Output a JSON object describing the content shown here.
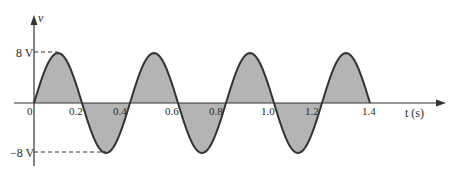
{
  "chart_data": {
    "type": "line",
    "title": "",
    "xlabel": "t (s)",
    "ylabel": "v",
    "function": "v(t) = 8 sin(2*pi*t/0.4) V",
    "amplitude": 8,
    "period": 0.4,
    "x_ticks": [
      "0",
      "0.2",
      "0.4",
      "0.6",
      "0.8",
      "1.0",
      "1.2",
      "1.4"
    ],
    "y_ticks": [
      "8 V",
      "-8 V"
    ],
    "x": [
      0,
      0.1,
      0.2,
      0.3,
      0.4,
      0.5,
      0.6,
      0.7,
      0.8,
      0.9,
      1.0,
      1.1,
      1.2,
      1.3,
      1.4
    ],
    "values": [
      0,
      8,
      0,
      -8,
      0,
      8,
      0,
      -8,
      0,
      8,
      0,
      -8,
      0,
      8,
      0
    ],
    "xlim": [
      0,
      1.4
    ],
    "ylim": [
      -8,
      8
    ],
    "shaded_area": true,
    "fill_color": "#b4b4b4",
    "line_color": "#333333",
    "grid": false,
    "legend": "none"
  },
  "labels": {
    "y_axis": "v",
    "x_axis": "t (s)",
    "pos_peak": "8 V",
    "neg_peak": "−8 V",
    "origin": "0",
    "t02": "0.2",
    "t04": "0.4",
    "t06": "0.6",
    "t08": "0.8",
    "t10": "1.0",
    "t12": "1.2",
    "t14": "1.4"
  }
}
